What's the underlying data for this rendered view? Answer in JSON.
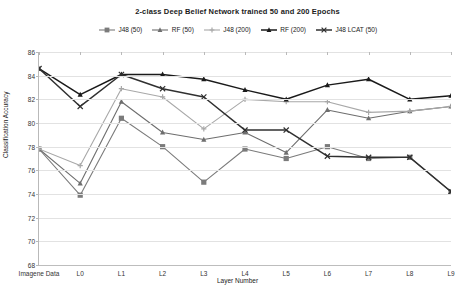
{
  "chart_data": {
    "type": "line",
    "title": "2-class Deep Belief Network trained 50 and 200 Epochs",
    "xlabel": "Layer Number",
    "ylabel": "Classification Accuracy",
    "categories": [
      "Imagene Data",
      "L0",
      "L1",
      "L2",
      "L3",
      "L4",
      "L5",
      "L6",
      "L7",
      "L8",
      "L9"
    ],
    "ylim": [
      68,
      86
    ],
    "yticks": [
      68,
      70,
      72,
      74,
      76,
      78,
      80,
      82,
      84,
      86
    ],
    "grid": true,
    "legend_position": "top",
    "series": [
      {
        "name": "J48 (50)",
        "color": "#7b7b7b",
        "marker": "square",
        "values": [
          77.8,
          73.9,
          80.4,
          78.0,
          75.0,
          77.8,
          77.0,
          78.0,
          77.0,
          77.1,
          74.2
        ]
      },
      {
        "name": "RF (50)",
        "color": "#6e6e6e",
        "marker": "triangle",
        "values": [
          77.8,
          74.9,
          81.8,
          79.2,
          78.6,
          79.2,
          77.5,
          81.1,
          80.4,
          81.0,
          81.4
        ]
      },
      {
        "name": "J48 (200)",
        "color": "#a8a8a8",
        "marker": "plus",
        "values": [
          77.8,
          76.4,
          82.9,
          82.2,
          79.5,
          82.0,
          81.8,
          81.8,
          80.9,
          81.0,
          81.4
        ]
      },
      {
        "name": "RF (200)",
        "color": "#1a1a1a",
        "marker": "triangle",
        "values": [
          84.6,
          82.4,
          84.1,
          84.1,
          83.7,
          82.8,
          82.0,
          83.2,
          83.7,
          82.0,
          82.3
        ]
      },
      {
        "name": "J48 LCAT (50)",
        "color": "#303030",
        "marker": "cross",
        "values": [
          84.6,
          81.4,
          84.1,
          82.9,
          82.2,
          79.4,
          79.4,
          77.2,
          77.1,
          77.1,
          74.2
        ]
      }
    ]
  }
}
